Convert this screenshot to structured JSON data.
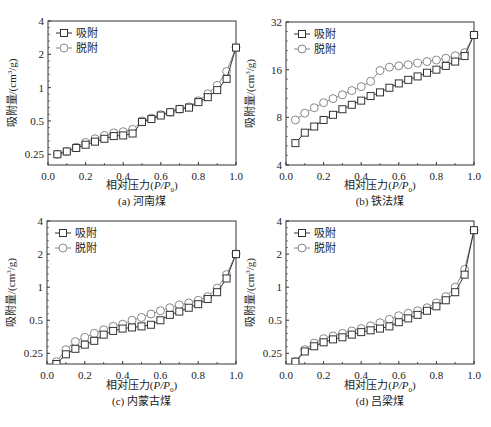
{
  "legend": {
    "adsorption": "吸附",
    "desorption": "脱附"
  },
  "colors": {
    "adsorption": "#333333",
    "desorption": "#888888",
    "axis": "#333333"
  },
  "chart_data": [
    {
      "type": "line",
      "panel": "a",
      "title": "(a) 河南煤",
      "xlabel": "相对压力(P/P0)",
      "ylabel": "吸附量/(cm³/g)",
      "yscale": "log2",
      "ylim": [
        0.2,
        4
      ],
      "xlim": [
        0.0,
        1.0
      ],
      "xticks": [
        "0.0",
        "0.2",
        "0.4",
        "0.6",
        "0.8",
        "1.0"
      ],
      "yticks": [
        "0.25",
        "0.5",
        "1",
        "2",
        "4"
      ],
      "ytick_values": [
        0.25,
        0.5,
        1,
        2,
        4
      ],
      "legend_position": "upper left",
      "x": [
        0.05,
        0.1,
        0.15,
        0.2,
        0.25,
        0.3,
        0.35,
        0.4,
        0.45,
        0.5,
        0.55,
        0.6,
        0.65,
        0.7,
        0.75,
        0.8,
        0.85,
        0.9,
        0.95,
        1.0
      ],
      "series": [
        {
          "name": "吸附",
          "marker": "square",
          "values": [
            0.25,
            0.265,
            0.285,
            0.305,
            0.325,
            0.345,
            0.365,
            0.37,
            0.385,
            0.49,
            0.52,
            0.56,
            0.6,
            0.64,
            0.66,
            0.74,
            0.82,
            0.95,
            1.2,
            2.3
          ]
        },
        {
          "name": "脱附",
          "marker": "circle",
          "values": [
            0.25,
            0.265,
            0.29,
            0.32,
            0.345,
            0.37,
            0.39,
            0.4,
            0.42,
            0.5,
            0.53,
            0.57,
            0.6,
            0.64,
            0.67,
            0.76,
            0.88,
            1.05,
            1.4,
            2.3
          ]
        }
      ]
    },
    {
      "type": "line",
      "panel": "b",
      "title": "(b) 铁法煤",
      "xlabel": "相对压力(P/P0)",
      "ylabel": "吸附量/(cm³/g)",
      "yscale": "log2",
      "ylim": [
        4,
        32
      ],
      "xlim": [
        0.0,
        1.0
      ],
      "xticks": [
        "0.0",
        "0.2",
        "0.4",
        "0.6",
        "0.8",
        "1.0"
      ],
      "yticks": [
        "4",
        "8",
        "16",
        "32"
      ],
      "ytick_values": [
        4,
        8,
        16,
        32
      ],
      "legend_position": "upper left",
      "x": [
        0.05,
        0.1,
        0.15,
        0.2,
        0.25,
        0.3,
        0.35,
        0.4,
        0.45,
        0.5,
        0.55,
        0.6,
        0.65,
        0.7,
        0.75,
        0.8,
        0.85,
        0.9,
        0.95,
        1.0
      ],
      "series": [
        {
          "name": "吸附",
          "marker": "square",
          "values": [
            5.5,
            6.4,
            7.0,
            7.7,
            8.3,
            9.0,
            9.6,
            10.2,
            10.9,
            11.5,
            12.3,
            13.1,
            13.8,
            14.5,
            15.3,
            16.0,
            16.9,
            18.0,
            19.5,
            26.5
          ]
        },
        {
          "name": "脱附",
          "marker": "circle",
          "values": [
            7.7,
            8.5,
            9.2,
            9.9,
            10.5,
            11.1,
            11.8,
            12.5,
            13.5,
            15.8,
            16.6,
            16.9,
            17.2,
            17.6,
            18.0,
            18.4,
            18.9,
            19.6,
            20.5,
            26.5
          ]
        }
      ]
    },
    {
      "type": "line",
      "panel": "c",
      "title": "(c) 内蒙古煤",
      "xlabel": "相对压力(P/P0)",
      "ylabel": "吸附量/(cm³/g)",
      "yscale": "log2",
      "ylim": [
        0.2,
        4
      ],
      "xlim": [
        0.0,
        1.0
      ],
      "xticks": [
        "0.0",
        "0.2",
        "0.4",
        "0.6",
        "0.8",
        "1.0"
      ],
      "yticks": [
        "0.25",
        "0.5",
        "1",
        "2",
        "4"
      ],
      "ytick_values": [
        0.25,
        0.5,
        1,
        2,
        4
      ],
      "legend_position": "upper left",
      "x": [
        0.05,
        0.1,
        0.15,
        0.2,
        0.25,
        0.3,
        0.35,
        0.4,
        0.45,
        0.5,
        0.55,
        0.6,
        0.65,
        0.7,
        0.75,
        0.8,
        0.85,
        0.9,
        0.95,
        1.0
      ],
      "series": [
        {
          "name": "吸附",
          "marker": "square",
          "values": [
            0.2,
            0.245,
            0.275,
            0.3,
            0.325,
            0.37,
            0.4,
            0.42,
            0.43,
            0.44,
            0.455,
            0.5,
            0.56,
            0.6,
            0.65,
            0.7,
            0.78,
            0.9,
            1.2,
            2.0
          ]
        },
        {
          "name": "脱附",
          "marker": "circle",
          "values": [
            0.21,
            0.27,
            0.32,
            0.35,
            0.38,
            0.41,
            0.44,
            0.46,
            0.5,
            0.53,
            0.57,
            0.61,
            0.65,
            0.69,
            0.72,
            0.76,
            0.82,
            0.98,
            1.3,
            2.0
          ]
        }
      ]
    },
    {
      "type": "line",
      "panel": "d",
      "title": "(d) 吕梁煤",
      "xlabel": "相对压力(P/P0)",
      "ylabel": "吸附量/(cm³/g)",
      "yscale": "log2",
      "ylim": [
        0.2,
        4
      ],
      "xlim": [
        0.0,
        1.0
      ],
      "xticks": [
        "0.0",
        "0.2",
        "0.4",
        "0.6",
        "0.8",
        "1.0"
      ],
      "yticks": [
        "0.25",
        "0.5",
        "1",
        "2",
        "4"
      ],
      "ytick_values": [
        0.25,
        0.5,
        1,
        2,
        4
      ],
      "legend_position": "upper left",
      "x": [
        0.05,
        0.1,
        0.15,
        0.2,
        0.25,
        0.3,
        0.35,
        0.4,
        0.45,
        0.5,
        0.55,
        0.6,
        0.65,
        0.7,
        0.75,
        0.8,
        0.85,
        0.9,
        0.95,
        1.0
      ],
      "series": [
        {
          "name": "吸附",
          "marker": "square",
          "values": [
            0.21,
            0.26,
            0.29,
            0.315,
            0.335,
            0.35,
            0.37,
            0.39,
            0.405,
            0.42,
            0.44,
            0.48,
            0.52,
            0.56,
            0.61,
            0.67,
            0.76,
            0.9,
            1.3,
            3.3
          ]
        },
        {
          "name": "脱附",
          "marker": "circle",
          "values": [
            0.21,
            0.27,
            0.31,
            0.34,
            0.36,
            0.38,
            0.4,
            0.42,
            0.445,
            0.475,
            0.51,
            0.55,
            0.58,
            0.61,
            0.65,
            0.72,
            0.82,
            1.0,
            1.45,
            3.3
          ]
        }
      ]
    }
  ],
  "panels": [
    {
      "caption": "(a)  河南煤"
    },
    {
      "caption": "(b)  铁法煤"
    },
    {
      "caption": "(c)  内蒙古煤"
    },
    {
      "caption": "(d)  吕梁煤"
    }
  ],
  "axis": {
    "xlabel_main": "相对压力(",
    "xlabel_italic": "P/P",
    "xlabel_sub": "0",
    "xlabel_end": ")",
    "ylabel_main": "吸附量/(cm",
    "ylabel_sup": "3",
    "ylabel_end": "/g)"
  }
}
